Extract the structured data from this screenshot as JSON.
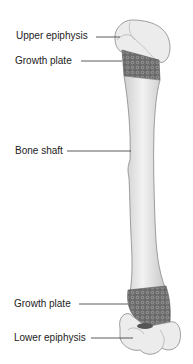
{
  "diagram": {
    "labels": [
      {
        "id": "upper-epiphysis",
        "text": "Upper epiphysis"
      },
      {
        "id": "growth-plate-upper",
        "text": "Growth plate"
      },
      {
        "id": "bone-shaft",
        "text": "Bone shaft"
      },
      {
        "id": "growth-plate-lower",
        "text": "Growth plate"
      },
      {
        "id": "lower-epiphysis",
        "text": "Lower epiphysis"
      }
    ],
    "colors": {
      "bone": "#ececec",
      "bone_shadow": "#c8c8c8",
      "outline": "#777777",
      "growth_plate": "#6e6e6e",
      "leader_line": "#333333"
    }
  }
}
